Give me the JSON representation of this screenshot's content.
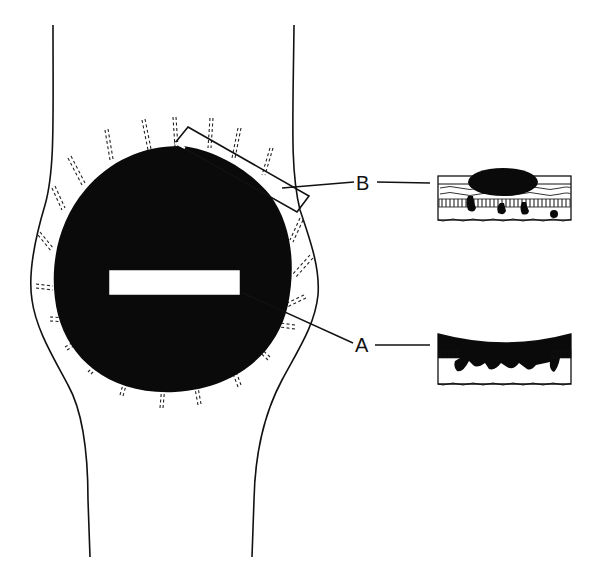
{
  "diagram": {
    "colors": {
      "ink": "#111111",
      "background": "#ffffff"
    },
    "labels": {
      "a": "A",
      "b": "B"
    },
    "callouts": [
      {
        "label": "A",
        "points_to": "white-rectangle-in-center",
        "inset": "inset-a-cross-section"
      },
      {
        "label": "B",
        "points_to": "rectangle-at-lesion-edge",
        "inset": "inset-b-cross-section"
      }
    ]
  }
}
